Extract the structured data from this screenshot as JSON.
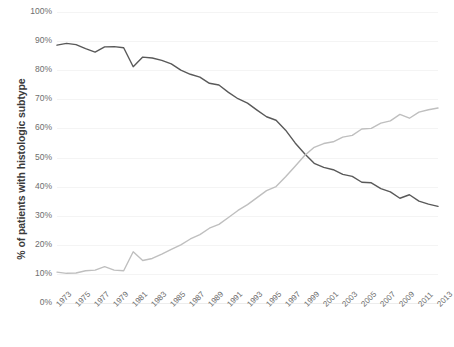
{
  "chart_data": {
    "type": "line",
    "title": "",
    "xlabel": "",
    "ylabel": "% of patients with histologic subtype",
    "ylim": [
      0,
      100
    ],
    "xlim": [
      1973,
      2013
    ],
    "grid": true,
    "legend": "none",
    "ytick_labels": [
      "100%",
      "90%",
      "80%",
      "70%",
      "60%",
      "50%",
      "40%",
      "30%",
      "20%",
      "10%",
      "0%"
    ],
    "ytick_values": [
      100,
      90,
      80,
      70,
      60,
      50,
      40,
      30,
      20,
      10,
      0
    ],
    "xtick_labels": [
      "1973",
      "1975",
      "1977",
      "1979",
      "1981",
      "1983",
      "1985",
      "1987",
      "1989",
      "1991",
      "1993",
      "1995",
      "1997",
      "1999",
      "2001",
      "2003",
      "2005",
      "2007",
      "2009",
      "2011",
      "2013"
    ],
    "x": [
      1973,
      1974,
      1975,
      1976,
      1977,
      1978,
      1979,
      1980,
      1981,
      1982,
      1983,
      1984,
      1985,
      1986,
      1987,
      1988,
      1989,
      1990,
      1991,
      1992,
      1993,
      1994,
      1995,
      1996,
      1997,
      1998,
      1999,
      2000,
      2001,
      2002,
      2003,
      2004,
      2005,
      2006,
      2007,
      2008,
      2009,
      2010,
      2011,
      2012,
      2013
    ],
    "series": [
      {
        "name": "squamous-cell-carcinoma",
        "color": "#595959",
        "values": [
          88.6,
          89.2,
          88.8,
          87.4,
          86.2,
          88.0,
          88.1,
          87.7,
          81.2,
          84.5,
          84.2,
          83.4,
          82.2,
          80.0,
          78.6,
          77.6,
          75.5,
          74.9,
          72.4,
          70.2,
          68.7,
          66.3,
          64.0,
          62.8,
          59.4,
          55.0,
          51.3,
          48.0,
          46.6,
          45.8,
          44.2,
          43.5,
          41.5,
          41.3,
          39.3,
          38.2,
          36.0,
          37.2,
          35.0,
          34.0,
          33.2
        ]
      },
      {
        "name": "adenocarcinoma",
        "color": "#bfbfbf",
        "values": [
          10.6,
          10.2,
          10.3,
          11.1,
          11.3,
          12.5,
          11.3,
          11.1,
          17.6,
          14.6,
          15.3,
          16.8,
          18.4,
          20.0,
          22.0,
          23.5,
          25.7,
          27.0,
          29.4,
          31.8,
          33.8,
          36.2,
          38.6,
          40.0,
          43.4,
          47.0,
          50.7,
          53.5,
          54.8,
          55.4,
          57.0,
          57.6,
          59.8,
          60.0,
          61.8,
          62.6,
          64.8,
          63.5,
          65.6,
          66.4,
          67.0
        ]
      }
    ]
  }
}
